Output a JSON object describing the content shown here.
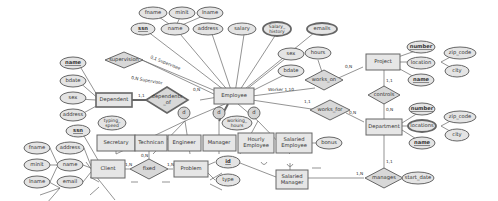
{
  "diagram": {
    "type": "ER diagram",
    "entities": {
      "employee": "Employee",
      "dependent": "Dependent",
      "project": "Project",
      "department": "Department",
      "secretary": "Secretary",
      "technician": "Technican",
      "engineer": "Engineer",
      "manager": "Manager",
      "hourly_employee_1": "Hourly",
      "hourly_employee_2": "Employee",
      "salaried_employee_1": "Salaried",
      "salaried_employee_2": "Employee",
      "salaried_manager_1": "Salaried",
      "salaried_manager_2": "Manager",
      "client": "Client",
      "problem": "Problem"
    },
    "relationships": {
      "supervision": "supervision",
      "dependents_of_1": "dependents",
      "dependents_of_2": "_of",
      "works_on": "works_on",
      "works_for": "works_for",
      "controls": "controls",
      "manages": "manages",
      "fixed": "fixed"
    },
    "attributes": {
      "emp_fname": "fname",
      "emp_minit": "minit",
      "emp_lname": "lname",
      "emp_ssn": "ssn",
      "emp_name": "name",
      "emp_address": "address",
      "emp_salary": "salary",
      "emp_salary_history_1": "Salary_",
      "emp_salary_history_2": "history",
      "emp_emails": "emails",
      "emp_sex": "sex",
      "emp_bdate": "bdate",
      "hours": "hours",
      "proj_number": "number",
      "proj_location": "location",
      "proj_name": "name",
      "proj_zip": "zip_code",
      "proj_city": "city",
      "dept_number": "number",
      "dept_locations": "locations",
      "dept_name": "name",
      "dept_zip": "zip_code",
      "dept_city": "city",
      "start_date": "start_date",
      "dep_name": "name",
      "dep_bdate": "bdate",
      "dep_sex": "sex",
      "dep_address": "address",
      "typing_speed_1": "typing_",
      "typing_speed_2": "speed",
      "working_hours_1": "working_",
      "working_hours_2": "hours",
      "bonus": "bonus",
      "client_ssn": "ssn",
      "client_address": "address",
      "client_name": "name",
      "client_email": "email",
      "client_fname": "fname",
      "client_minit": "minit",
      "client_lname": "lname",
      "problem_id": "id",
      "problem_type": "type"
    },
    "specialization_marks": {
      "d1": "d",
      "d2": "d",
      "d3": "d"
    },
    "cardinalities": {
      "supervision_supervisee": "0,1 Supervisee",
      "supervision_supervisor": "0,N Supervisor",
      "dependents_emp": "0,N",
      "dependents_dep": "1,1",
      "works_on_proj": "0,N",
      "works_on_emp": "Worker 1,10",
      "works_for_emp": "1,1",
      "works_for_dept": "0,N",
      "controls_proj": "1,1",
      "controls_dept": "0,N",
      "manages_dept": "1,1",
      "manages_mgr": "1,N",
      "fixed_client": "1,N",
      "fixed_tech": "0,N",
      "fixed_problem": "1,N"
    }
  }
}
